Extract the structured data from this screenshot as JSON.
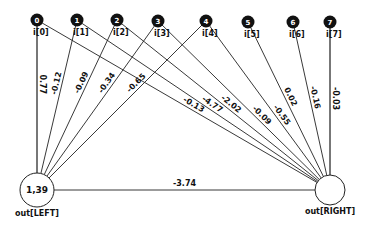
{
  "diagram": {
    "type": "neural-network",
    "inputs": [
      {
        "id": "0",
        "label": "i[0]",
        "x": 37,
        "y": 20
      },
      {
        "id": "1",
        "label": "i[1]",
        "x": 77,
        "y": 20
      },
      {
        "id": "2",
        "label": "i[2]",
        "x": 117,
        "y": 20
      },
      {
        "id": "3",
        "label": "i[3]",
        "x": 158,
        "y": 21
      },
      {
        "id": "4",
        "label": "i[4]",
        "x": 206,
        "y": 21
      },
      {
        "id": "5",
        "label": "i[5]",
        "x": 248,
        "y": 22
      },
      {
        "id": "6",
        "label": "i[6]",
        "x": 293,
        "y": 22
      },
      {
        "id": "7",
        "label": "i[7]",
        "x": 330,
        "y": 22
      }
    ],
    "outputs": [
      {
        "id": "left",
        "label": "out[LEFT]",
        "value": "1,39",
        "x": 37,
        "y": 190,
        "r": 17
      },
      {
        "id": "right",
        "label": "out[RIGHT]",
        "value": "",
        "x": 330,
        "y": 190,
        "r": 15
      }
    ],
    "edges": [
      {
        "from": "0",
        "to": "left",
        "weight": "0.77"
      },
      {
        "from": "1",
        "to": "left",
        "weight": "-0.12"
      },
      {
        "from": "2",
        "to": "left",
        "weight": "-0.09"
      },
      {
        "from": "3",
        "to": "left",
        "weight": "-0.34"
      },
      {
        "from": "4",
        "to": "left",
        "weight": "-0.65"
      },
      {
        "from": "0",
        "to": "right",
        "weight": "-0.13"
      },
      {
        "from": "1",
        "to": "right",
        "weight": "-4.77"
      },
      {
        "from": "2",
        "to": "right",
        "weight": "-2.02"
      },
      {
        "from": "3",
        "to": "right",
        "weight": "-0.09"
      },
      {
        "from": "4",
        "to": "right",
        "weight": "-0.55"
      },
      {
        "from": "5",
        "to": "right",
        "weight": "0.02"
      },
      {
        "from": "6",
        "to": "right",
        "weight": "-0.16"
      },
      {
        "from": "7",
        "to": "right",
        "weight": "-0.03"
      },
      {
        "from": "left",
        "to": "right",
        "weight": "-3.74"
      }
    ]
  }
}
